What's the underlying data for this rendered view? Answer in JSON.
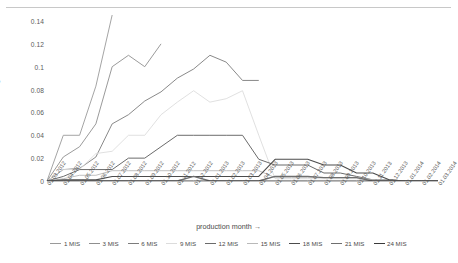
{
  "axes": {
    "y_title": "damage rate →",
    "x_title": "production month →",
    "y_ticks": [
      "0",
      "0.02",
      "0.04",
      "0.06",
      "0.08",
      "0.1",
      "0.12",
      "0.14"
    ]
  },
  "chart_data": {
    "type": "line",
    "title": "",
    "xlabel": "production month →",
    "ylabel": "damage rate →",
    "ylim": [
      0,
      0.14
    ],
    "ytick_values": [
      0,
      0.02,
      0.04,
      0.06,
      0.08,
      0.1,
      0.12,
      0.14
    ],
    "grid": false,
    "legend_position": "bottom",
    "categories": [
      "01.03.2012",
      "01.04.2012",
      "01.05.2012",
      "01.06.2012",
      "01.07.2012",
      "01.08.2012",
      "01.09.2012",
      "01.10.2012",
      "01.11.2012",
      "01.12.2012",
      "01.01.2013",
      "01.02.2013",
      "01.03.2013",
      "01.04.2013",
      "01.05.2013",
      "01.06.2013",
      "01.07.2013",
      "01.08.2013",
      "01.09.2013",
      "01.10.2013",
      "01.11.2013",
      "01.12.2013",
      "01.01.2014",
      "01.02.2014",
      "01.03.2014"
    ],
    "series": [
      {
        "name": "1 MIS",
        "color": "#9a9a9a",
        "width": 0.9,
        "values": [
          0,
          0.04,
          0.04,
          0.083,
          0.148,
          null,
          null,
          null,
          null,
          null,
          null,
          null,
          null,
          null,
          null,
          null,
          null,
          null,
          null,
          null,
          null,
          null,
          null,
          null,
          null
        ]
      },
      {
        "name": "3 MIS",
        "color": "#8f8f8f",
        "width": 0.9,
        "values": [
          0,
          0.021,
          0.03,
          0.05,
          0.1,
          0.11,
          0.1,
          0.12,
          null,
          null,
          null,
          null,
          null,
          null,
          null,
          null,
          null,
          null,
          null,
          null,
          null,
          null,
          null,
          null,
          null
        ]
      },
      {
        "name": "6 MIS",
        "color": "#7c7c7c",
        "width": 0.9,
        "values": [
          0,
          0.01,
          0.011,
          0.021,
          0.05,
          0.058,
          0.07,
          0.078,
          0.09,
          0.098,
          0.11,
          0.104,
          0.088,
          0.088,
          null,
          null,
          null,
          null,
          null,
          null,
          null,
          null,
          null,
          null,
          null
        ]
      },
      {
        "name": "9 MIS",
        "color": "#dcdcdc",
        "width": 0.9,
        "values": [
          0,
          0.01,
          0.01,
          0.024,
          0.026,
          0.04,
          0.04,
          0.058,
          0.069,
          0.079,
          0.069,
          0.072,
          0.079,
          0.04,
          0.002,
          0.002,
          0.002,
          0.002,
          0.002,
          0.002,
          0.0,
          0.0,
          0.0,
          0.0,
          0.0
        ]
      },
      {
        "name": "12 MIS",
        "color": "#6b6b6b",
        "width": 1.0,
        "values": [
          0,
          0.004,
          0.01,
          0.01,
          0.01,
          0.02,
          0.02,
          0.03,
          0.04,
          0.04,
          0.04,
          0.04,
          0.04,
          0.019,
          0.014,
          0.014,
          0.014,
          0.007,
          0.007,
          0.004,
          0.001,
          0.001,
          0.0,
          0.0,
          0.0
        ]
      },
      {
        "name": "15 MIS",
        "color": "#b9b9b9",
        "width": 0.9,
        "values": [
          0,
          0.002,
          0.005,
          0.005,
          0.009,
          0.009,
          0.009,
          0.009,
          0.009,
          0.009,
          0.009,
          0.009,
          0.009,
          0.009,
          0.003,
          0.003,
          0.003,
          0.003,
          0.003,
          0.003,
          0.001,
          0.001,
          0.0,
          0.0,
          0.0
        ]
      },
      {
        "name": "18 MIS",
        "color": "#4c4c4c",
        "width": 1.1,
        "values": [
          0,
          0.001,
          0.001,
          0.001,
          0.004,
          0.004,
          0.004,
          0.004,
          0.004,
          0.004,
          0.004,
          0.004,
          0.004,
          0.004,
          0.019,
          0.019,
          0.019,
          0.014,
          0.014,
          0.007,
          0.007,
          0.001,
          0.0,
          0.0,
          0.0
        ]
      },
      {
        "name": "21 MIS",
        "color": "#6f6f6f",
        "width": 1.3,
        "values": [
          0,
          0.0,
          0.0,
          0.0,
          0.0,
          0.0,
          0.0,
          0.0,
          0.0,
          0.004,
          0.0,
          0.0,
          0.0,
          0.0,
          0.004,
          0.004,
          0.004,
          0.003,
          0.003,
          0.003,
          0.0,
          0.0,
          0.0,
          0.0,
          0.0
        ]
      },
      {
        "name": "24 MIS",
        "color": "#3a3a3a",
        "width": 1.0,
        "values": [
          0,
          0.0,
          0.0,
          0.0,
          0.0,
          0.0,
          0.0,
          0.0,
          0.0,
          0.0,
          0.0,
          0.0,
          0.0,
          0.0,
          0.0,
          0.0,
          0.0,
          0.0,
          0.0,
          0.0,
          0.0,
          0.0,
          0.0,
          0.0,
          0.0
        ]
      }
    ]
  }
}
